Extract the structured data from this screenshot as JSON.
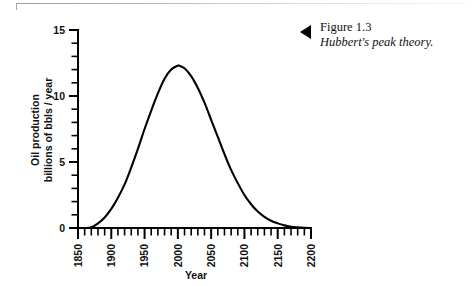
{
  "figure": {
    "marker_icon": "left-triangle-icon",
    "caption_number": "Figure 1.3",
    "caption_title": "Hubbert's peak theory."
  },
  "chart_data": {
    "type": "line",
    "title": "",
    "xlabel": "Year",
    "ylabel": "Oil production\nbillions of bbls / year",
    "ylabel_line1": "Oil production",
    "ylabel_line2": "billions of bbls / year",
    "xlim": [
      1850,
      2200
    ],
    "ylim": [
      0,
      15
    ],
    "x_major_ticks": [
      1850,
      1900,
      1950,
      2000,
      2050,
      2100,
      2150,
      2200
    ],
    "x_tick_labels": [
      "1850",
      "1900",
      "1950",
      "2000",
      "2050",
      "2100",
      "2150",
      "2200"
    ],
    "x_minor_tick_step": 10,
    "y_major_ticks": [
      0,
      5,
      10,
      15
    ],
    "y_tick_labels": [
      "0",
      "5",
      "10",
      "15"
    ],
    "y_minor_tick_step": 1,
    "grid": false,
    "legend": false,
    "line_color": "#000000",
    "peak_year": 2002,
    "peak_value": 12.3,
    "x": [
      1850,
      1860,
      1870,
      1880,
      1890,
      1900,
      1910,
      1920,
      1930,
      1940,
      1950,
      1960,
      1970,
      1980,
      1990,
      2000,
      2002,
      2010,
      2020,
      2030,
      2040,
      2050,
      2060,
      2070,
      2080,
      2090,
      2100,
      2110,
      2120,
      2130,
      2140,
      2150,
      2160,
      2170,
      2180,
      2190,
      2200
    ],
    "values": [
      0.0,
      0.0,
      0.05,
      0.35,
      0.8,
      1.45,
      2.3,
      3.3,
      4.6,
      6.0,
      7.5,
      8.9,
      10.2,
      11.3,
      12.0,
      12.3,
      12.3,
      12.1,
      11.5,
      10.6,
      9.5,
      8.2,
      6.9,
      5.6,
      4.4,
      3.4,
      2.5,
      1.8,
      1.25,
      0.85,
      0.55,
      0.35,
      0.2,
      0.1,
      0.05,
      0.02,
      0.0
    ]
  }
}
